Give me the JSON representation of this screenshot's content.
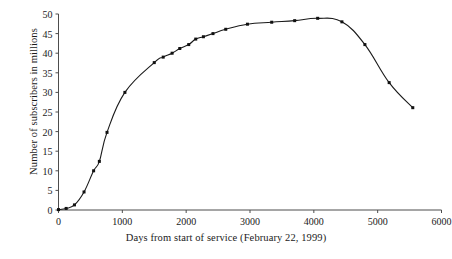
{
  "chart_data": {
    "type": "line",
    "title": "",
    "subtitle": "",
    "xlabel": "Days from start of service (February 22, 1999)",
    "ylabel": "Number of subscribers in millions",
    "xlim": [
      0,
      6000
    ],
    "ylim": [
      0,
      50
    ],
    "xticks": [
      0,
      1000,
      2000,
      3000,
      4000,
      5000,
      6000
    ],
    "yticks": [
      0,
      5,
      10,
      15,
      20,
      25,
      30,
      35,
      40,
      45,
      50
    ],
    "xticklabels": [
      "0",
      "1000",
      "2000",
      "3000",
      "4000",
      "5000",
      "6000"
    ],
    "yticklabels": [
      "0",
      "5",
      "10",
      "15",
      "20",
      "25",
      "30",
      "35",
      "40",
      "45",
      "50"
    ],
    "grid": false,
    "legend": null,
    "legend_position": "none",
    "marker": "square",
    "line_color": "#1a1a1a",
    "marker_color": "#111111",
    "series": [
      {
        "name": "Subscribers",
        "x": [
          0,
          120,
          250,
          400,
          550,
          640,
          760,
          1040,
          1500,
          1640,
          1780,
          1900,
          2040,
          2150,
          2270,
          2420,
          2620,
          2960,
          3340,
          3700,
          4060,
          4440,
          4800,
          5180,
          5550
        ],
        "y": [
          0.1,
          0.4,
          1.3,
          4.6,
          10.0,
          12.4,
          19.8,
          30.0,
          37.6,
          39.0,
          40.0,
          41.2,
          42.2,
          43.6,
          44.2,
          45.0,
          46.1,
          47.4,
          47.9,
          48.3,
          48.9,
          48.0,
          42.2,
          32.5,
          26.1
        ]
      }
    ]
  },
  "axes": {
    "x_title": "Days from start of service (February 22, 1999)",
    "y_title": "Number of subscribers in millions"
  }
}
